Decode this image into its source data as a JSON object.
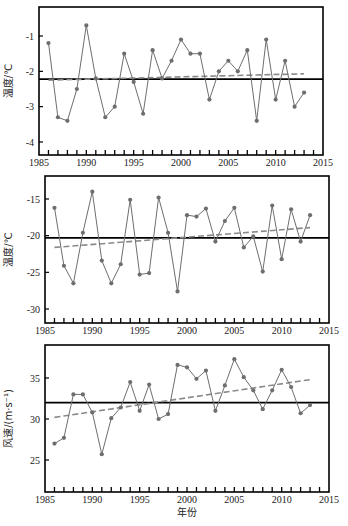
{
  "chart_data": [
    {
      "type": "line",
      "title": "",
      "xlabel": "",
      "ylabel": "温度/℃",
      "xlim": [
        1985,
        2015
      ],
      "ylim": [
        -4.4,
        -0.2
      ],
      "xticks": [
        1985,
        1990,
        1995,
        2000,
        2005,
        2010,
        2015
      ],
      "yticks": [
        -4,
        -3,
        -2,
        -1
      ],
      "x": [
        1986,
        1987,
        1988,
        1989,
        1990,
        1991,
        1992,
        1993,
        1994,
        1995,
        1996,
        1997,
        1998,
        1999,
        2000,
        2001,
        2002,
        2003,
        2004,
        2005,
        2006,
        2007,
        2008,
        2009,
        2010,
        2011,
        2012,
        2013
      ],
      "series": [
        {
          "name": "observed",
          "style": "solid-markers",
          "color": "#6e6e6e",
          "values": [
            -1.2,
            -3.3,
            -3.4,
            -2.5,
            -0.7,
            -2.2,
            -3.3,
            -3.0,
            -1.5,
            -2.3,
            -3.2,
            -1.4,
            -2.2,
            -1.7,
            -1.1,
            -1.5,
            -1.5,
            -2.8,
            -2.0,
            -1.7,
            -2.0,
            -1.4,
            -3.4,
            -1.1,
            -2.8,
            -1.7,
            -3.0,
            -2.6
          ]
        },
        {
          "name": "mean",
          "style": "solid",
          "color": "#000000",
          "values": [
            -2.22
          ]
        },
        {
          "name": "linear trend",
          "style": "dashed",
          "color": "#808080",
          "start": [
            1986,
            -2.25
          ],
          "end": [
            2013,
            -2.07
          ]
        }
      ],
      "grid": false,
      "legend": null
    },
    {
      "type": "line",
      "title": "",
      "xlabel": "",
      "ylabel": "温度/℃",
      "xlim": [
        1985,
        2015
      ],
      "ylim": [
        -32,
        -12
      ],
      "xticks": [
        1985,
        1990,
        1995,
        2000,
        2005,
        2010,
        2015
      ],
      "yticks": [
        -30,
        -25,
        -20,
        -15
      ],
      "x": [
        1986,
        1987,
        1988,
        1989,
        1990,
        1991,
        1992,
        1993,
        1994,
        1995,
        1996,
        1997,
        1998,
        1999,
        2000,
        2001,
        2002,
        2003,
        2004,
        2005,
        2006,
        2007,
        2008,
        2009,
        2010,
        2011,
        2012,
        2013
      ],
      "series": [
        {
          "name": "observed",
          "style": "solid-markers",
          "color": "#6e6e6e",
          "values": [
            -16.2,
            -24.1,
            -26.5,
            -19.6,
            -14.0,
            -23.4,
            -26.5,
            -23.9,
            -15.1,
            -25.3,
            -25.1,
            -14.8,
            -19.6,
            -27.6,
            -17.2,
            -17.4,
            -16.3,
            -20.8,
            -18.0,
            -16.2,
            -21.6,
            -20.1,
            -24.9,
            -15.9,
            -23.2,
            -16.4,
            -20.8,
            -17.2
          ]
        },
        {
          "name": "mean",
          "style": "solid",
          "color": "#000000",
          "values": [
            -20.3
          ]
        },
        {
          "name": "linear trend",
          "style": "dashed",
          "color": "#808080",
          "start": [
            1986,
            -21.6
          ],
          "end": [
            2013,
            -18.9
          ]
        }
      ],
      "grid": false,
      "legend": null
    },
    {
      "type": "line",
      "title": "",
      "xlabel": "年份",
      "ylabel": "风速/(m·s⁻¹)",
      "xlim": [
        1985,
        2015
      ],
      "ylim": [
        21,
        39
      ],
      "xticks": [
        1985,
        1990,
        1995,
        2000,
        2005,
        2010,
        2015
      ],
      "yticks": [
        25,
        30,
        35
      ],
      "x": [
        1986,
        1987,
        1988,
        1989,
        1990,
        1991,
        1992,
        1993,
        1994,
        1995,
        1996,
        1997,
        1998,
        1999,
        2000,
        2001,
        2002,
        2003,
        2004,
        2005,
        2006,
        2007,
        2008,
        2009,
        2010,
        2011,
        2012,
        2013
      ],
      "series": [
        {
          "name": "observed",
          "style": "solid-markers",
          "color": "#6e6e6e",
          "values": [
            27.0,
            27.7,
            33.0,
            33.0,
            30.8,
            25.7,
            30.1,
            31.4,
            34.5,
            31.0,
            34.2,
            30.0,
            30.6,
            36.6,
            36.3,
            34.9,
            35.9,
            31.0,
            34.1,
            37.3,
            35.1,
            33.5,
            31.2,
            33.5,
            36.0,
            33.9,
            30.7,
            31.7
          ]
        },
        {
          "name": "mean",
          "style": "solid",
          "color": "#000000",
          "values": [
            32.0
          ]
        },
        {
          "name": "linear trend",
          "style": "dashed",
          "color": "#808080",
          "start": [
            1986,
            30.2
          ],
          "end": [
            2013,
            34.8
          ]
        }
      ],
      "grid": false,
      "legend": null
    }
  ],
  "panels": [
    {
      "frame": {
        "left": 39,
        "right": 323,
        "top": 7,
        "bottom": 155
      },
      "yScale": {
        "v0": -1,
        "p0": 36,
        "v1": -4,
        "p1": 142
      }
    },
    {
      "frame": {
        "left": 45,
        "right": 329,
        "top": 176,
        "bottom": 323
      },
      "yScale": {
        "v0": -15,
        "p0": 199,
        "v1": -30,
        "p1": 309
      }
    },
    {
      "frame": {
        "left": 45,
        "right": 329,
        "top": 345,
        "bottom": 492
      },
      "yScale": {
        "v0": 35,
        "p0": 378,
        "v1": 25,
        "p1": 460
      }
    }
  ],
  "colors": {
    "series": "#6e6e6e",
    "mean": "#000000",
    "trend": "#8a8a8a",
    "frame": "#000000"
  }
}
